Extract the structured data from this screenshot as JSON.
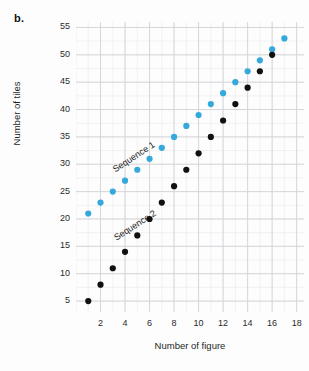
{
  "figure": {
    "panel_letter": "b.",
    "background_color": "#fdfdfd"
  },
  "chart_data": {
    "type": "scatter",
    "title": "",
    "xlabel": "Number of figure",
    "ylabel": "Number of tiles",
    "xlim": [
      0,
      18.6
    ],
    "ylim": [
      3,
      56
    ],
    "xticks": [
      2,
      4,
      6,
      8,
      10,
      12,
      14,
      16,
      18
    ],
    "yticks": [
      5,
      10,
      15,
      20,
      25,
      30,
      35,
      40,
      45,
      50,
      55
    ],
    "grid": true,
    "grid_minor": true,
    "legend": "inline-annotations",
    "annotations": [
      {
        "text": "Sequence 1",
        "x": 3.2,
        "y": 28.5,
        "rotation": -33,
        "color": "#1a1a1a"
      },
      {
        "text": "Sequence 2",
        "x": 3.3,
        "y": 16.0,
        "rotation": -33,
        "color": "#1a1a1a"
      }
    ],
    "series": [
      {
        "name": "Sequence 1",
        "color": "#35a8dc",
        "marker": "circle",
        "x": [
          1,
          2,
          3,
          4,
          5,
          6,
          7,
          8,
          9,
          10,
          11,
          12,
          13,
          14,
          15,
          16,
          17
        ],
        "values": [
          21,
          23,
          25,
          27,
          29,
          31,
          33,
          35,
          37,
          39,
          41,
          43,
          45,
          47,
          49,
          51,
          53
        ]
      },
      {
        "name": "Sequence 2",
        "color": "#111111",
        "marker": "circle",
        "x": [
          1,
          2,
          3,
          4,
          5,
          6,
          7,
          8,
          9,
          10,
          11,
          12,
          13,
          14,
          15,
          16
        ],
        "values": [
          5,
          8,
          11,
          14,
          17,
          20,
          23,
          26,
          29,
          32,
          35,
          38,
          41,
          44,
          47,
          50
        ]
      }
    ]
  }
}
